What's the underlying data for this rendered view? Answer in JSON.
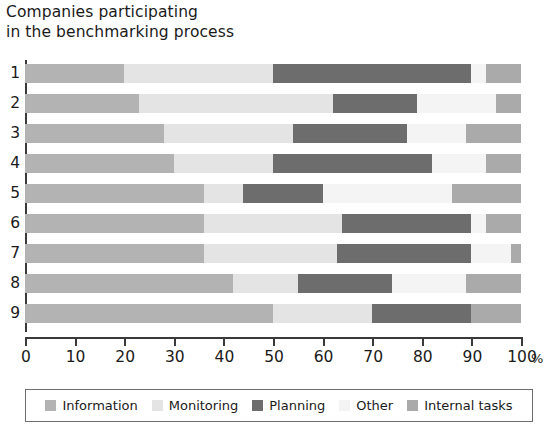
{
  "title": {
    "line1": "Companies participating",
    "line2": "in the benchmarking process"
  },
  "axis": {
    "unit": "%",
    "ticks": [
      "0",
      "10",
      "20",
      "30",
      "40",
      "50",
      "60",
      "70",
      "80",
      "90",
      "100"
    ]
  },
  "legend": {
    "items": [
      {
        "label": "Information",
        "color": "#b3b3b3"
      },
      {
        "label": "Monitoring",
        "color": "#e4e4e4"
      },
      {
        "label": "Planning",
        "color": "#6d6d6d"
      },
      {
        "label": "Other",
        "color": "#f4f4f4"
      },
      {
        "label": "Internal tasks",
        "color": "#aaaaaa"
      }
    ]
  },
  "chart_data": {
    "type": "bar",
    "orientation": "horizontal",
    "stacked": true,
    "title": "Companies participating in the benchmarking process",
    "xlabel": "%",
    "ylabel": "",
    "xlim": [
      0,
      100
    ],
    "grid": false,
    "legend_position": "bottom",
    "categories": [
      "1",
      "2",
      "3",
      "4",
      "5",
      "6",
      "7",
      "8",
      "9"
    ],
    "series": [
      {
        "name": "Information",
        "color": "#b3b3b3",
        "values": [
          20,
          23,
          28,
          30,
          36,
          36,
          36,
          42,
          50
        ]
      },
      {
        "name": "Monitoring",
        "color": "#e4e4e4",
        "values": [
          30,
          39,
          26,
          20,
          8,
          28,
          27,
          13,
          20
        ]
      },
      {
        "name": "Planning",
        "color": "#6d6d6d",
        "values": [
          40,
          17,
          23,
          32,
          16,
          26,
          27,
          19,
          20
        ]
      },
      {
        "name": "Other",
        "color": "#f4f4f4",
        "values": [
          3,
          16,
          12,
          11,
          26,
          3,
          8,
          15,
          0
        ]
      },
      {
        "name": "Internal tasks",
        "color": "#aaaaaa",
        "values": [
          7,
          5,
          11,
          7,
          14,
          7,
          2,
          11,
          10
        ]
      }
    ]
  }
}
